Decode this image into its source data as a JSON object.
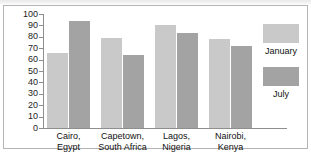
{
  "chart_data": {
    "type": "bar",
    "title": "",
    "xlabel": "",
    "ylabel": "",
    "ylim": [
      0,
      100
    ],
    "ytick_step": 10,
    "yticks": [
      "100",
      "90",
      "80",
      "70",
      "60",
      "50",
      "40",
      "30",
      "20",
      "10",
      "0"
    ],
    "grid": false,
    "legend_position": "right",
    "categories": [
      "Cairo,\nEgypt",
      "Capetown,\nSouth Africa",
      "Lagos,\nNigeria",
      "Nairobi,\nKenya"
    ],
    "category_lines": [
      [
        "Cairo,",
        "Egypt"
      ],
      [
        "Capetown,",
        "South Africa"
      ],
      [
        "Lagos,",
        "Nigeria"
      ],
      [
        "Nairobi,",
        "Kenya"
      ]
    ],
    "series": [
      {
        "name": "January",
        "color": "#c9c9c9",
        "values": [
          66,
          79,
          90,
          78
        ]
      },
      {
        "name": "July",
        "color": "#a3a3a3",
        "values": [
          94,
          64,
          83,
          72
        ]
      }
    ]
  },
  "legend": {
    "items": [
      {
        "label": "January",
        "color": "#c9c9c9"
      },
      {
        "label": "July",
        "color": "#a3a3a3"
      }
    ]
  },
  "colors": {
    "january": "#c9c9c9",
    "july": "#a3a3a3",
    "axis": "#8e8e8e",
    "frame": "#b4b4b4",
    "text": "#111111"
  }
}
